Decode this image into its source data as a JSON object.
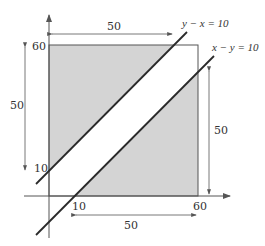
{
  "diagram": {
    "type": "geometric-region-plot",
    "colors": {
      "shade": "#d4d4d4",
      "line": "#2a2a2a",
      "axis": "#555555",
      "text": "#333333"
    },
    "axes": {
      "x_tick_labels": [
        "10",
        "60"
      ],
      "y_tick_labels": [
        "10",
        "60"
      ]
    },
    "lines": [
      {
        "label": "y − x = 10"
      },
      {
        "label": "x − y = 10"
      }
    ],
    "dimensions": {
      "top": "50",
      "left": "50",
      "right": "50",
      "bottom": "50"
    },
    "square": {
      "from": 0,
      "to": 60
    }
  }
}
